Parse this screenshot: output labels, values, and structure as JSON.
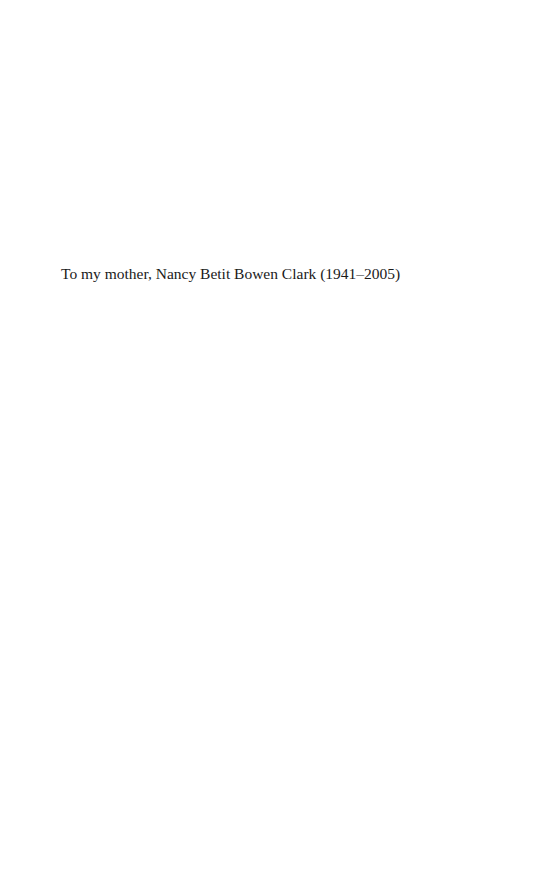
{
  "page": {
    "type": "dedication-page",
    "dedication": "To my mother, Nancy Betit Bowen Clark (1941–2005)"
  }
}
